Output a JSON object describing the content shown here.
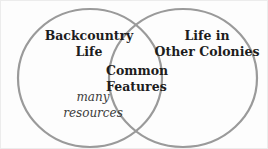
{
  "venn": {
    "colors": {
      "circle_stroke": "#9a9a9a",
      "title_text": "#1d1d1d",
      "note_text": "#3c3c3c",
      "background": "#fdfdfd"
    },
    "left": {
      "title_line1": "Backcountry",
      "title_line2": "Life",
      "note_line1": "many",
      "note_line2": "resources"
    },
    "right": {
      "title_line1": "Life in",
      "title_line2": "Other Colonies"
    },
    "overlap": {
      "title_line1": "Common",
      "title_line2": "Features"
    }
  }
}
